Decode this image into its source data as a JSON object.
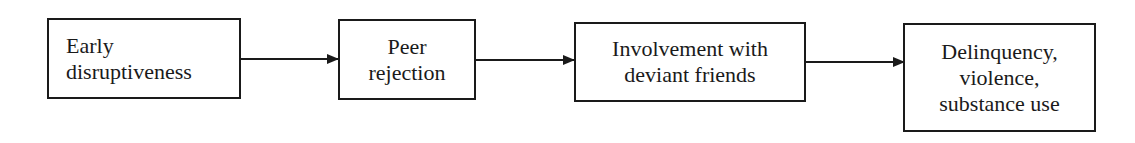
{
  "diagram": {
    "type": "flowchart",
    "direction": "left-to-right",
    "nodes": [
      {
        "id": "n1",
        "lines": [
          "Early",
          "disruptiveness"
        ]
      },
      {
        "id": "n2",
        "lines": [
          "Peer",
          "rejection"
        ]
      },
      {
        "id": "n3",
        "lines": [
          "Involvement with",
          "deviant friends"
        ]
      },
      {
        "id": "n4",
        "lines": [
          "Delinquency,",
          "violence,",
          "substance use"
        ]
      }
    ],
    "edges": [
      {
        "from": "n1",
        "to": "n2"
      },
      {
        "from": "n2",
        "to": "n3"
      },
      {
        "from": "n3",
        "to": "n4"
      }
    ],
    "colors": {
      "stroke": "#1a1a1a",
      "background": "#ffffff"
    }
  }
}
